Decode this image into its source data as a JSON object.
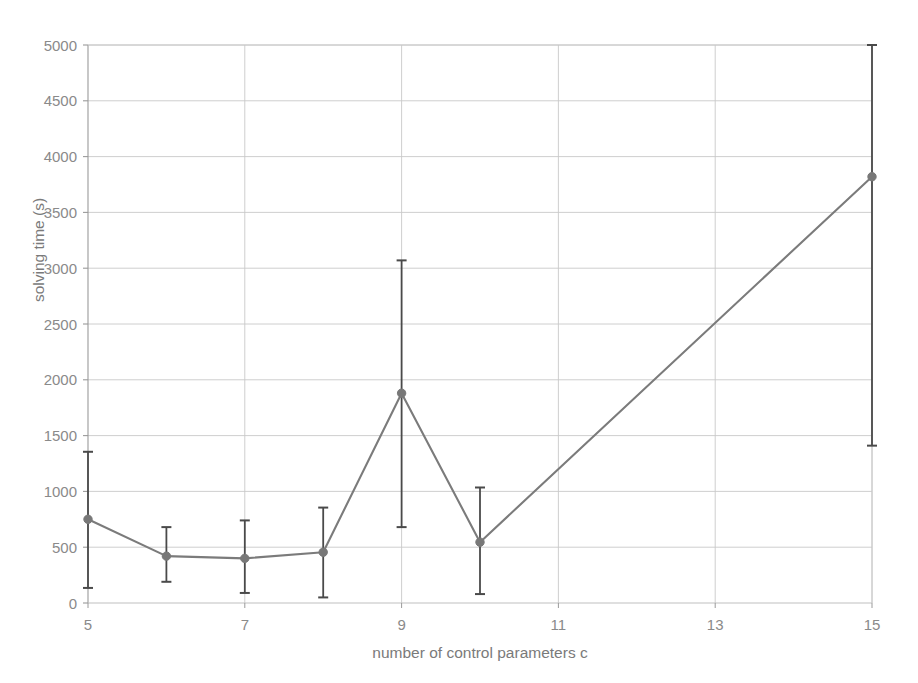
{
  "chart_data": {
    "type": "line",
    "title": "",
    "subtitle": "",
    "xlabel": "number of control parameters c",
    "ylabel": "solving time (s)",
    "xlim": [
      5,
      15
    ],
    "ylim": [
      0,
      5000
    ],
    "x_ticks": [
      5,
      7,
      9,
      11,
      13,
      15
    ],
    "x_tick_labels": [
      "5",
      "7",
      "9",
      "11",
      "13",
      "15"
    ],
    "y_ticks": [
      0,
      500,
      1000,
      1500,
      2000,
      2500,
      3000,
      3500,
      4000,
      4500,
      5000
    ],
    "y_tick_labels": [
      "0",
      "500",
      "1000",
      "1500",
      "2000",
      "2500",
      "3000",
      "3500",
      "4000",
      "4500",
      "5000"
    ],
    "grid": "both",
    "legend": "none",
    "x": [
      5,
      6,
      7,
      8,
      9,
      10,
      15
    ],
    "values": [
      750,
      420,
      400,
      455,
      1880,
      545,
      3820
    ],
    "error_low": [
      135,
      190,
      90,
      50,
      680,
      80,
      1410
    ],
    "error_high": [
      1355,
      680,
      740,
      855,
      3070,
      1035,
      5000
    ],
    "series": [
      {
        "name": "solving time",
        "values": [
          750,
          420,
          400,
          455,
          1880,
          545,
          3820
        ]
      }
    ],
    "annotations": [],
    "line_color": "#7b7b7b",
    "marker_color": "#787878",
    "errorbar_color": "#4a4a4a",
    "grid_color": "#c8c8c8",
    "axis_color": "#9a9a9a",
    "background_color": "#ffffff",
    "note_top_errorbar_clipped": "error bar at c=15 reaches the top of the plot area (5000)"
  },
  "axes": {
    "x_title": "number of control parameters c",
    "y_title": "solving time (s)"
  }
}
